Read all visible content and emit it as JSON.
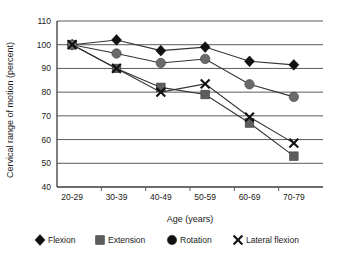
{
  "chart_data": {
    "type": "line",
    "title": "",
    "xlabel": "Age (years)",
    "ylabel": "Cervical range of motion (percent)",
    "categories": [
      "20-29",
      "30-39",
      "40-49",
      "50-59",
      "60-69",
      "70-79"
    ],
    "ylim": [
      40,
      110
    ],
    "yticks": [
      40,
      50,
      60,
      70,
      80,
      90,
      100,
      110
    ],
    "grid": true,
    "legend_position": "bottom",
    "series": [
      {
        "name": "Flexion",
        "marker": "diamond",
        "color": "#111111",
        "values": [
          100,
          102,
          97.5,
          99,
          93,
          91.5
        ]
      },
      {
        "name": "Extension",
        "marker": "square",
        "color": "#5d5d5d",
        "values": [
          100,
          90,
          82,
          79,
          67,
          53
        ]
      },
      {
        "name": "Rotation",
        "marker": "circle",
        "color": "#6b6b6b",
        "values": [
          100,
          96.3,
          92.3,
          94,
          83.3,
          78
        ]
      },
      {
        "name": "Lateral flexion",
        "marker": "x",
        "color": "#111111",
        "values": [
          100,
          90,
          80,
          83.5,
          69.5,
          58.5
        ]
      }
    ]
  },
  "legend": {
    "items": [
      {
        "label": "Flexion",
        "marker": "diamond",
        "color": "#111111"
      },
      {
        "label": "Extension",
        "marker": "square",
        "color": "#5d5d5d"
      },
      {
        "label": "Rotation",
        "marker": "circle",
        "color": "#111111"
      },
      {
        "label": "Lateral flexion",
        "marker": "x",
        "color": "#111111"
      }
    ]
  }
}
